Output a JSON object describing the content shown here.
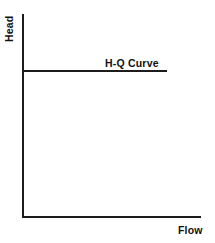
{
  "chart_data": {
    "type": "line",
    "title": "",
    "subtitle": "",
    "xlabel": "Flow",
    "ylabel": "Head",
    "grid": false,
    "legend_position": "none",
    "xlim": [
      0,
      100
    ],
    "ylim": [
      0,
      100
    ],
    "xticks": [],
    "yticks": [],
    "xticklabels": [],
    "yticklabels": [],
    "annotations": [
      {
        "name": "hq-curve-label",
        "text": "H-Q Curve",
        "x": 57,
        "y": 76
      }
    ],
    "series": [
      {
        "name": "H-Q Curve",
        "label": "H-Q Curve",
        "color": "#1c1c1c",
        "x": [
          0,
          81
        ],
        "values": [
          72,
          72
        ]
      }
    ]
  },
  "axes": {
    "y_axis_label": "Head",
    "x_axis_label": "Flow",
    "axis_color": "#1c1c1c",
    "background_color": "#ffffff"
  },
  "curve": {
    "label": "H-Q Curve",
    "color": "#1c1c1c"
  }
}
